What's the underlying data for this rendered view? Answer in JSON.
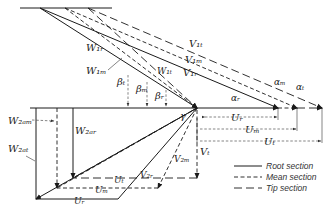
{
  "diagram": {
    "labels": {
      "W1r": "W₁ᵣ",
      "W1m": "W₁ₘ",
      "W1t": "W₁ₜ",
      "V1t": "V₁ₜ",
      "V1m": "V₁ₘ",
      "V1r": "V₁ᵣ",
      "beta_t": "βₜ",
      "beta_m": "βₘ",
      "beta_r": "βᵣ",
      "gamma": "γ",
      "alpha_r": "αᵣ",
      "alpha_m": "αₘ",
      "alpha_t": "αₜ",
      "Ur": "Uᵣ",
      "Um": "Uₘ",
      "Ut": "Uₜ",
      "Ur_bottom": "Uᵣ",
      "Um_bottom": "Uₘ",
      "Ut_bottom": "Uₜ",
      "W2am": "W₂ₐₘ",
      "W2at": "W₂ₐₜ",
      "W2ar": "W₂ₐᵣ",
      "V2r": "V₂ᵣ",
      "V2m": "V₂ₘ",
      "Vt": "Vₜ"
    },
    "legend": [
      {
        "style": "solid",
        "label": "Root section"
      },
      {
        "style": "mean",
        "label": "Mean section"
      },
      {
        "style": "tip",
        "label": "Tip section"
      }
    ]
  }
}
